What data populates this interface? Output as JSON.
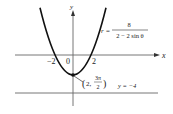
{
  "diagram": {
    "type": "polar conic (parabola) graph",
    "axes": {
      "x_label": "x",
      "y_label": "y",
      "tick_labels": [
        "−2",
        "0",
        "2"
      ]
    },
    "equation": {
      "lhs": "r =",
      "numerator": "8",
      "denominator": "2 − 2 sin θ"
    },
    "vertex_point": {
      "open": "(",
      "first": "2,",
      "frac_num": "3π",
      "frac_den": "2",
      "close": ")"
    },
    "directrix_label": "y = −4",
    "colors": {
      "curve": "#111111",
      "axes": "#555555",
      "text": "#222222"
    }
  }
}
